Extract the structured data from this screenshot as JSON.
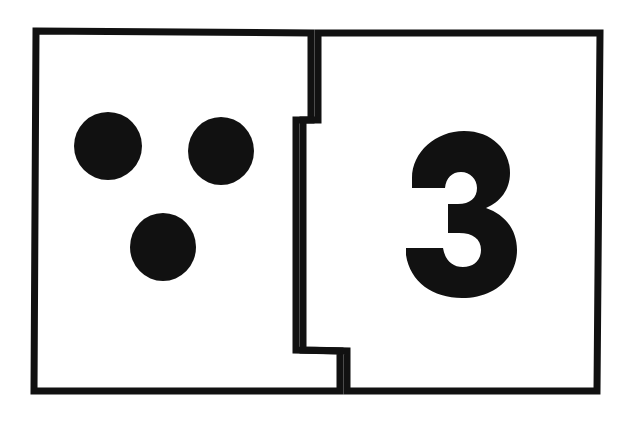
{
  "scene": {
    "description": "Two interlocking jigsaw-style flashcard halves photographed on a white background",
    "background_color": "#ffffff",
    "ink_color": "#111111",
    "card_fill_color": "#ffffff"
  },
  "card": {
    "outline_color": "#111111",
    "outline_width": 7,
    "left_piece": {
      "name": "dots-half",
      "quantity_shown": 3
    },
    "right_piece": {
      "name": "numeral-half",
      "numeral": "3"
    }
  },
  "dots": {
    "count": 3,
    "color": "#111111",
    "items": [
      {
        "label": "dot-1",
        "cx": 108,
        "cy": 146,
        "rx": 34,
        "ry": 34
      },
      {
        "label": "dot-2",
        "cx": 221,
        "cy": 151,
        "rx": 33,
        "ry": 34
      },
      {
        "label": "dot-3",
        "cx": 163,
        "cy": 247,
        "rx": 33,
        "ry": 34
      }
    ]
  },
  "numeral": {
    "value": "3",
    "color": "#111111",
    "center_x": 458,
    "baseline_y": 283
  },
  "geometry": {
    "left_edge_x": 36,
    "right_edge_x": 598,
    "top_edge_y": 31,
    "bottom_edge_y": 391,
    "seam_upper_x": 311,
    "seam_middle_x": 296,
    "seam_lower_x": 340,
    "seam_step_top_y": 120,
    "seam_step_bottom_y": 350
  }
}
